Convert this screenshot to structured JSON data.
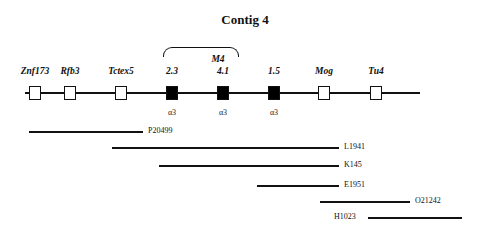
{
  "title": "Contig 4",
  "bracket": {
    "label": "M4",
    "from": 163,
    "to": 237
  },
  "map": {
    "line": {
      "x1": 25,
      "x2": 420,
      "y": 93
    },
    "genes": [
      {
        "label": "Znf173",
        "x": 35,
        "filled": false,
        "sub": ""
      },
      {
        "label": "Rfb3",
        "x": 70,
        "filled": false,
        "sub": ""
      },
      {
        "label": "Tctex5",
        "x": 121,
        "filled": false,
        "sub": ""
      },
      {
        "label": "2.3",
        "x": 172,
        "filled": true,
        "sub": "α3"
      },
      {
        "label": "4.1",
        "x": 223,
        "filled": true,
        "sub": "α3"
      },
      {
        "label": "1.5",
        "x": 274,
        "filled": true,
        "sub": "α3"
      },
      {
        "label": "Mog",
        "x": 324,
        "filled": false,
        "sub": ""
      },
      {
        "label": "Tu4",
        "x": 376,
        "filled": false,
        "sub": ""
      }
    ]
  },
  "clones": [
    {
      "label": "P20499",
      "x1": 29,
      "x2": 143,
      "y": 131,
      "label_side": "right"
    },
    {
      "label": "L1941",
      "x1": 112,
      "x2": 339,
      "y": 147,
      "label_side": "right"
    },
    {
      "label": "K145",
      "x1": 159,
      "x2": 339,
      "y": 165,
      "label_side": "right"
    },
    {
      "label": "E1951",
      "x1": 257,
      "x2": 339,
      "y": 185,
      "label_side": "right"
    },
    {
      "label": "O21242",
      "x1": 320,
      "x2": 410,
      "y": 201,
      "label_side": "right"
    },
    {
      "label": "H1023",
      "x1": 368,
      "x2": 462,
      "y": 217,
      "label_side": "left"
    }
  ]
}
